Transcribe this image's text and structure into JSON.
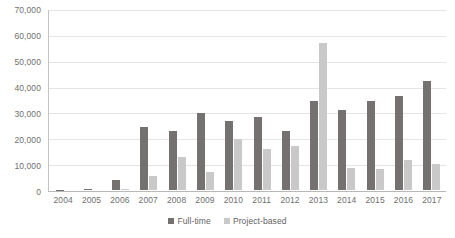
{
  "chart_data": {
    "type": "bar",
    "title": "",
    "subtitle": "",
    "xlabel": "",
    "ylabel": "",
    "ylim": [
      0,
      70000
    ],
    "yticks": [
      0,
      10000,
      20000,
      30000,
      40000,
      50000,
      60000,
      70000
    ],
    "ytick_labels": [
      "0",
      "10,000",
      "20,000",
      "30,000",
      "40,000",
      "50,000",
      "60,000",
      "70,000"
    ],
    "grid": true,
    "legend_position": "bottom",
    "categories": [
      "2004",
      "2005",
      "2006",
      "2007",
      "2008",
      "2009",
      "2010",
      "2011",
      "2012",
      "2013",
      "2014",
      "2015",
      "2016",
      "2017"
    ],
    "series": [
      {
        "name": "Full-time",
        "color": "#767171",
        "values": [
          100,
          300,
          4000,
          24500,
          23000,
          30000,
          27000,
          28500,
          23000,
          34500,
          31000,
          34500,
          36500,
          42500
        ]
      },
      {
        "name": "Project-based",
        "color": "#c9c9c9",
        "values": [
          0,
          0,
          300,
          5500,
          13000,
          7000,
          20000,
          16000,
          17000,
          57000,
          8500,
          8000,
          11500,
          10000
        ]
      }
    ]
  },
  "legend": {
    "items": [
      {
        "label": "Full-time",
        "color": "#767171"
      },
      {
        "label": "Project-based",
        "color": "#c9c9c9"
      }
    ]
  }
}
